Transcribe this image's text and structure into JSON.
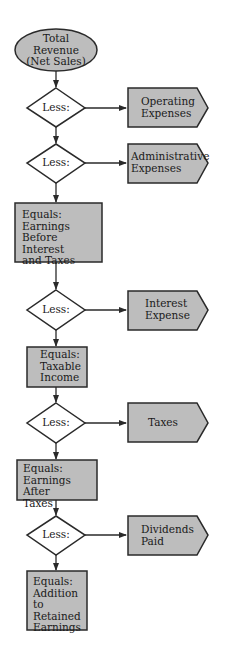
{
  "colors": {
    "fill": "#bdbdbd",
    "stroke": "#2a2a2a",
    "diamond_fill": "#ffffff",
    "text": "#1a1a1a"
  },
  "flow": {
    "start": "Total\nRevenue\n(Net Sales)",
    "step1": {
      "decision": "Less:",
      "deduction": "Operating\nExpenses"
    },
    "step2": {
      "decision": "Less:",
      "deduction": "Administrative\nExpenses"
    },
    "result1": "Equals:\nEarnings Before\nInterest\nand Taxes",
    "step3": {
      "decision": "Less:",
      "deduction": "Interest\nExpense"
    },
    "result2": "Equals:\nTaxable\nIncome",
    "step4": {
      "decision": "Less:",
      "deduction": "Taxes"
    },
    "result3": "Equals:\nEarnings After\nTaxes",
    "step5": {
      "decision": "Less:",
      "deduction": "Dividends\nPaid"
    },
    "result4": "Equals:\nAddition to\nRetained\nEarnings"
  }
}
